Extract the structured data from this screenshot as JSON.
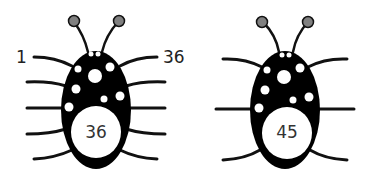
{
  "diagram": {
    "bugs": [
      {
        "id": "left",
        "legs_per_side": 5,
        "belly_number": "36",
        "leg_labels": {
          "left_top": "1",
          "right_top": "36"
        }
      },
      {
        "id": "right",
        "legs_per_side": 3,
        "belly_number": "45"
      }
    ],
    "colors": {
      "body": "#000000",
      "antenna_tip": "#808080",
      "spots": "#ffffff"
    }
  }
}
